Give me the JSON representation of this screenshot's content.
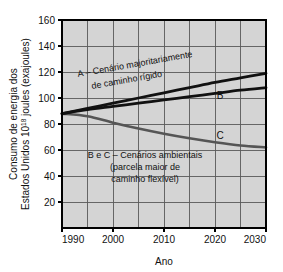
{
  "chart_data": {
    "type": "line",
    "title": "",
    "xlabel": "Ano",
    "ylabel_line1": "Consumo de energia dos",
    "ylabel_line2_a": "Estados Unidos 10",
    "ylabel_line2_sup": "18",
    "ylabel_line2_b": " joules (exajoules)",
    "xlim": [
      1990,
      2030
    ],
    "ylim": [
      0,
      160
    ],
    "grid": true,
    "x_major_ticks": [
      1990,
      2000,
      2010,
      2020,
      2030
    ],
    "x_tick_labels": [
      "1990",
      "2000",
      "2010",
      "2020",
      "2030"
    ],
    "x_minor_gridlines": [
      1995,
      2005,
      2015,
      2025
    ],
    "y_ticks": [
      20,
      40,
      60,
      80,
      100,
      120,
      140,
      160
    ],
    "y_tick_labels": [
      "20",
      "40",
      "60",
      "80",
      "100",
      "120",
      "140",
      "160"
    ],
    "legend_position": "inline-annotations",
    "x": [
      1990,
      1995,
      2000,
      2005,
      2010,
      2015,
      2020,
      2025,
      2030
    ],
    "series": [
      {
        "name": "A",
        "label": "A",
        "color": "#111111",
        "values": [
          88,
          92,
          96,
          100,
          104,
          108,
          112,
          115.5,
          119
        ]
      },
      {
        "name": "B",
        "label": "B",
        "color": "#111111",
        "values": [
          88,
          91,
          93.5,
          96,
          98.5,
          101,
          103.5,
          106,
          108
        ]
      },
      {
        "name": "C",
        "label": "C",
        "color": "#555555",
        "values": [
          88,
          86,
          81,
          76.5,
          72.5,
          69,
          66,
          63.5,
          62
        ]
      }
    ],
    "annotations": [
      {
        "id": "annot-a",
        "lines": [
          "A – Cenário majoritariamente",
          "de caminho rígido"
        ],
        "rotation": -10
      },
      {
        "id": "annot-bc",
        "lines": [
          "B e C – Cenários ambientais",
          "(parcela maior de",
          "caminho flexível)"
        ],
        "rotation": 0
      }
    ],
    "series_inline_labels": [
      {
        "text": "B",
        "x": 2021,
        "y": 99
      },
      {
        "text": "C",
        "x": 2021,
        "y": 68.5
      }
    ],
    "colors": {
      "plot_background": "#d4d4d4",
      "grid": "#5a5a5a",
      "axis_border": "#000000",
      "figure_background": "#ffffff",
      "text": "#111111"
    }
  }
}
